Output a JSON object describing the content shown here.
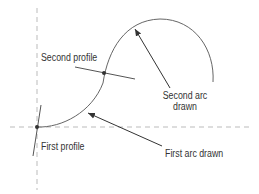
{
  "labels": {
    "second_profile": "Second profile",
    "second_arc_line1": "Second arc",
    "second_arc_line2": "drawn",
    "first_profile": "First profile",
    "first_arc": "First arc drawn"
  },
  "colors": {
    "line": "#555555",
    "dash": "#aaaaaa",
    "text": "#333333"
  }
}
